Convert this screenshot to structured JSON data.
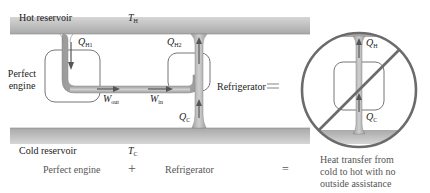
{
  "diagram": {
    "reservoirs": {
      "hot_label": "Hot reservoir",
      "hot_temp_symbol": "T",
      "hot_temp_sub": "H",
      "cold_label": "Cold reservoir",
      "cold_temp_symbol": "T",
      "cold_temp_sub": "C"
    },
    "engine": {
      "label_line1": "Perfect",
      "label_line2": "engine",
      "heat_in_symbol": "Q",
      "heat_in_sub": "H1",
      "work_out_symbol": "W",
      "work_out_sub": "out"
    },
    "refrigerator": {
      "label": "Refrigerator",
      "work_in_symbol": "W",
      "work_in_sub": "in",
      "heat_out_symbol": "Q",
      "heat_out_sub": "H2",
      "heat_in_symbol": "Q",
      "heat_in_sub": "C"
    },
    "equals_sign": "=",
    "forbidden_device": {
      "heat_hot_symbol": "Q",
      "heat_hot_sub": "H",
      "heat_cold_symbol": "Q",
      "heat_cold_sub": "C",
      "status": "prohibited"
    },
    "caption": {
      "term1": "Perfect engine",
      "plus": "+",
      "term2": "Refrigerator",
      "equals": "=",
      "result_line1": "Heat transfer from",
      "result_line2": "cold to hot with no",
      "result_line3": "outside assistance"
    },
    "colors": {
      "reservoir_fill": "#c8c8c8",
      "pipe_fill": "#b4b4b4",
      "arrow": "#555555",
      "prohibition_circle": "#6b6b6b",
      "device_outline": "#777777"
    }
  }
}
